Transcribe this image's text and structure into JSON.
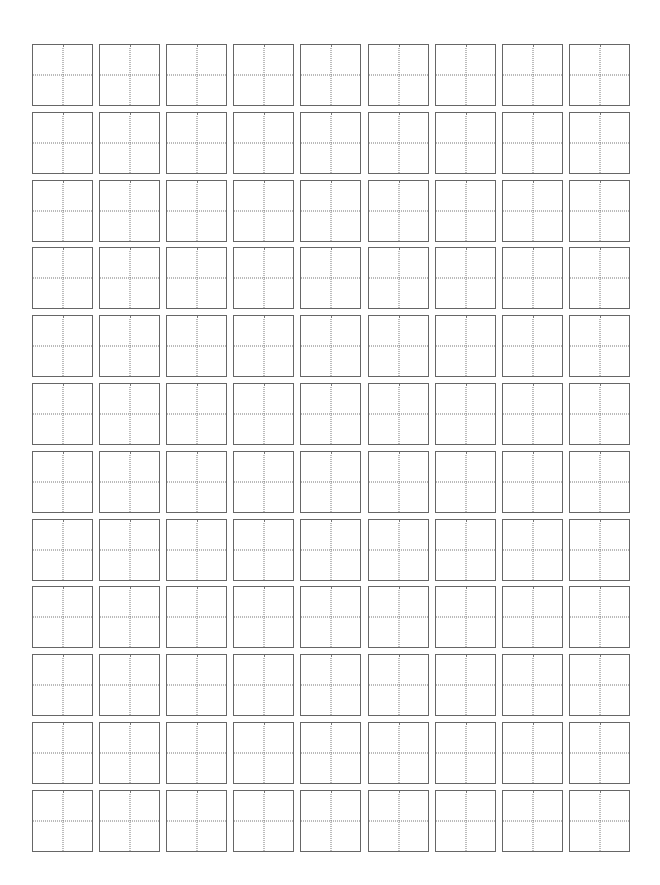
{
  "sheet": {
    "type": "tianzige-practice-grid",
    "columns": 9,
    "rows": 12,
    "cell_size": {
      "width": 61,
      "height": 62
    },
    "origin": {
      "x": 32,
      "y": 44
    },
    "step": {
      "x": 67.1,
      "y": 67.8
    },
    "colors": {
      "border": "#666666",
      "guide": "#777777",
      "background": "#ffffff"
    }
  }
}
